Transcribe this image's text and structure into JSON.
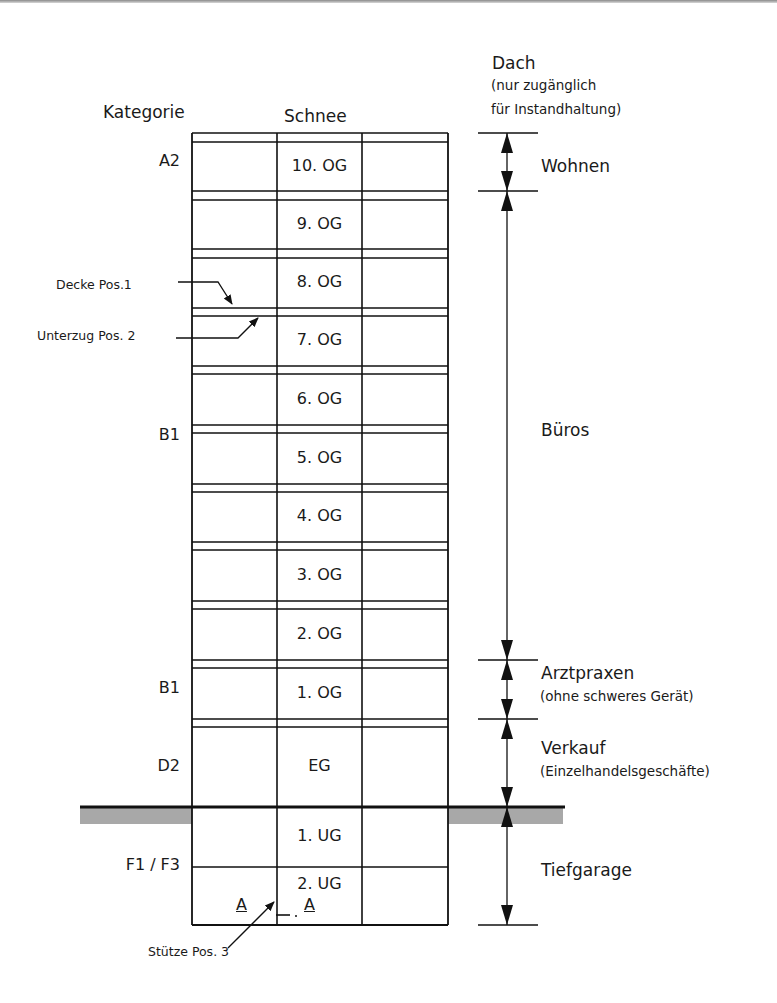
{
  "headers": {
    "category": "Kategorie",
    "snow": "Schnee",
    "roof": "Dach",
    "roof_note_1": "(nur zugänglich",
    "roof_note_2": "für Instandhaltung)"
  },
  "categories": [
    {
      "label": "A2",
      "y": 162
    },
    {
      "label": "B1",
      "y": 436
    },
    {
      "label": "B1",
      "y": 689
    },
    {
      "label": "D2",
      "y": 767
    },
    {
      "label": "F1 / F3",
      "y": 866
    }
  ],
  "floors": [
    {
      "label": "10. OG",
      "top": 142,
      "bottom": 191
    },
    {
      "label": "9. OG",
      "top": 200,
      "bottom": 249
    },
    {
      "label": "8. OG",
      "top": 258,
      "bottom": 308
    },
    {
      "label": "7. OG",
      "top": 316,
      "bottom": 366
    },
    {
      "label": "6. OG",
      "top": 374,
      "bottom": 425
    },
    {
      "label": "5. OG",
      "top": 433,
      "bottom": 484
    },
    {
      "label": "4. OG",
      "top": 492,
      "bottom": 542
    },
    {
      "label": "3. OG",
      "top": 550,
      "bottom": 601
    },
    {
      "label": "2. OG",
      "top": 609,
      "bottom": 660
    },
    {
      "label": "1. OG",
      "top": 668,
      "bottom": 719
    },
    {
      "label": "EG",
      "top": 727,
      "bottom": 807
    },
    {
      "label": "1. UG",
      "top": 807,
      "bottom": 867
    },
    {
      "label": "2. UG",
      "top": 867,
      "bottom": 925
    }
  ],
  "building": {
    "left": 192,
    "col1": 277,
    "col2": 362,
    "right": 448,
    "roof_top": 133,
    "ground": 807,
    "bottom": 925,
    "slab_pairs": [
      [
        133,
        142
      ],
      [
        191,
        200
      ],
      [
        249,
        258
      ],
      [
        308,
        316
      ],
      [
        366,
        374
      ],
      [
        425,
        433
      ],
      [
        484,
        492
      ],
      [
        542,
        550
      ],
      [
        601,
        609
      ],
      [
        660,
        668
      ],
      [
        719,
        727
      ]
    ],
    "ground_line": {
      "x1": 80,
      "x2": 565
    },
    "ground_hatch_color": "#a8a8a8"
  },
  "uses": [
    {
      "label": "Wohnen",
      "sub": "",
      "from": 133,
      "to": 191,
      "label_y": 168
    },
    {
      "label": "Büros",
      "sub": "",
      "from": 191,
      "to": 660,
      "label_y": 432
    },
    {
      "label": "Arztpraxen",
      "sub": "(ohne schweres Gerät)",
      "from": 660,
      "to": 719,
      "label_y": 675
    },
    {
      "label": "Verkauf",
      "sub": "(Einzelhandelsgeschäfte)",
      "from": 719,
      "to": 807,
      "label_y": 750
    },
    {
      "label": "Tiefgarage",
      "sub": "",
      "from": 807,
      "to": 925,
      "label_y": 872
    }
  ],
  "dimension_line": {
    "x": 507,
    "tick_x1": 478,
    "tick_x2": 538
  },
  "callouts": [
    {
      "label": "Decke Pos.1",
      "text_x": 56,
      "text_y": 286
    },
    {
      "label": "Unterzug Pos. 2",
      "text_x": 37,
      "text_y": 335
    },
    {
      "label": "Stütze Pos. 3",
      "text_x": 148,
      "text_y": 952
    }
  ],
  "section_marks": {
    "left": "A",
    "right": "A"
  },
  "colors": {
    "line": "#111111",
    "ground_hatch": "#a8a8a8",
    "text": "#1a1a1a"
  }
}
